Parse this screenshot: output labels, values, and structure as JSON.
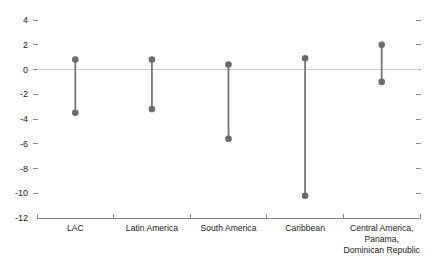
{
  "chart_data": {
    "type": "scatter",
    "title": "",
    "subtitle": "",
    "xlabel": "",
    "ylabel": "",
    "ylim": [
      -12,
      4
    ],
    "ytick_step": 2,
    "grid": false,
    "legend": "none",
    "zero_line": true,
    "categories": [
      "LAC",
      "Latin America",
      "South America",
      "Caribbean",
      "Central America, Panama, Dominican Republic"
    ],
    "category_lines": [
      [
        "LAC"
      ],
      [
        "Latin America"
      ],
      [
        "South America"
      ],
      [
        "Caribbean"
      ],
      [
        "Central America,",
        "Panama,",
        "Dominican Republic"
      ]
    ],
    "ytick_labels": [
      "4",
      "2",
      "0",
      "-2",
      "-4",
      "-6",
      "-8",
      "-10",
      "-12"
    ],
    "ytick_values": [
      4,
      2,
      0,
      -2,
      -4,
      -6,
      -8,
      -10,
      -12
    ],
    "series": [
      {
        "name": "high",
        "values": [
          0.8,
          0.8,
          0.4,
          0.9,
          2.0
        ]
      },
      {
        "name": "low",
        "values": [
          -3.5,
          -3.2,
          -5.6,
          -10.2,
          -1.0
        ]
      }
    ],
    "colors": {
      "marker": "#6b6b6b",
      "connector": "#7a7a7a",
      "axis": "#8a8a8a",
      "zero_line": "#c9c9c9",
      "text": "#1a1a1a",
      "background": "#ffffff"
    }
  }
}
